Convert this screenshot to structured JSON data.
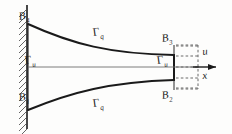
{
  "figure": {
    "domain": "Diagram",
    "background_color": "#fdfdfc",
    "ink_color": "#1a1a1a",
    "centerline_color": "#6d6d6d",
    "dashed_color": "#5a5a5a"
  },
  "labels": {
    "corner_top_left": {
      "symbol": "B",
      "subscript": "4",
      "name": "B4"
    },
    "corner_bottom_left": {
      "symbol": "B",
      "subscript": "1",
      "name": "B1"
    },
    "corner_top_right": {
      "symbol": "B",
      "subscript": "3",
      "name": "B3"
    },
    "corner_bottom_right": {
      "symbol": "B",
      "subscript": "2",
      "name": "B2"
    },
    "traction_top": {
      "symbol": "Γ",
      "subscript": "q",
      "name": "Gamma-q"
    },
    "traction_bottom": {
      "symbol": "Γ",
      "subscript": "q",
      "name": "Gamma-q"
    },
    "displacement_left": {
      "symbol": "Γ",
      "subscript": "u",
      "name": "Gamma-u"
    },
    "displacement_right": {
      "symbol": "Γ",
      "subscript": "u",
      "name": "Gamma-u"
    },
    "axis_u": {
      "symbol": "u",
      "name": "u"
    },
    "axis_x": {
      "symbol": "x",
      "name": "x"
    }
  },
  "elements": {
    "wall": {
      "name": "fixed-support-wall",
      "hatching": "diagonal",
      "x": 26,
      "y_top": 6,
      "y_bottom": 128
    },
    "top_boundary": {
      "name": "top-curved-edge",
      "shape": "concave-decreasing-curve"
    },
    "bottom_boundary": {
      "name": "bottom-curved-edge",
      "shape": "convex-increasing-curve"
    },
    "right_edge": {
      "name": "right-vertical-edge"
    },
    "centerline": {
      "name": "symmetry-centerline",
      "style": "thin-solid"
    },
    "load_arrows": {
      "name": "distributed-load-arrows",
      "count": 5,
      "style": "dashed",
      "direction": "right"
    },
    "axis_arrow": {
      "name": "x-axis-arrow",
      "direction": "right"
    }
  }
}
